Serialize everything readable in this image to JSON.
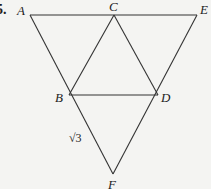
{
  "problem": {
    "number": "5."
  },
  "points": {
    "A": {
      "label": "A",
      "x": 30,
      "y": 15
    },
    "C": {
      "label": "C",
      "x": 114,
      "y": 15
    },
    "E": {
      "label": "E",
      "x": 197,
      "y": 15
    },
    "B": {
      "label": "B",
      "x": 69,
      "y": 95
    },
    "D": {
      "label": "D",
      "x": 158,
      "y": 95
    },
    "F": {
      "label": "F",
      "x": 113,
      "y": 174
    }
  },
  "segment_label": {
    "text": "√3",
    "segment": "BF"
  },
  "segments": [
    "AE",
    "AF",
    "EF",
    "CB",
    "CD",
    "BD"
  ]
}
